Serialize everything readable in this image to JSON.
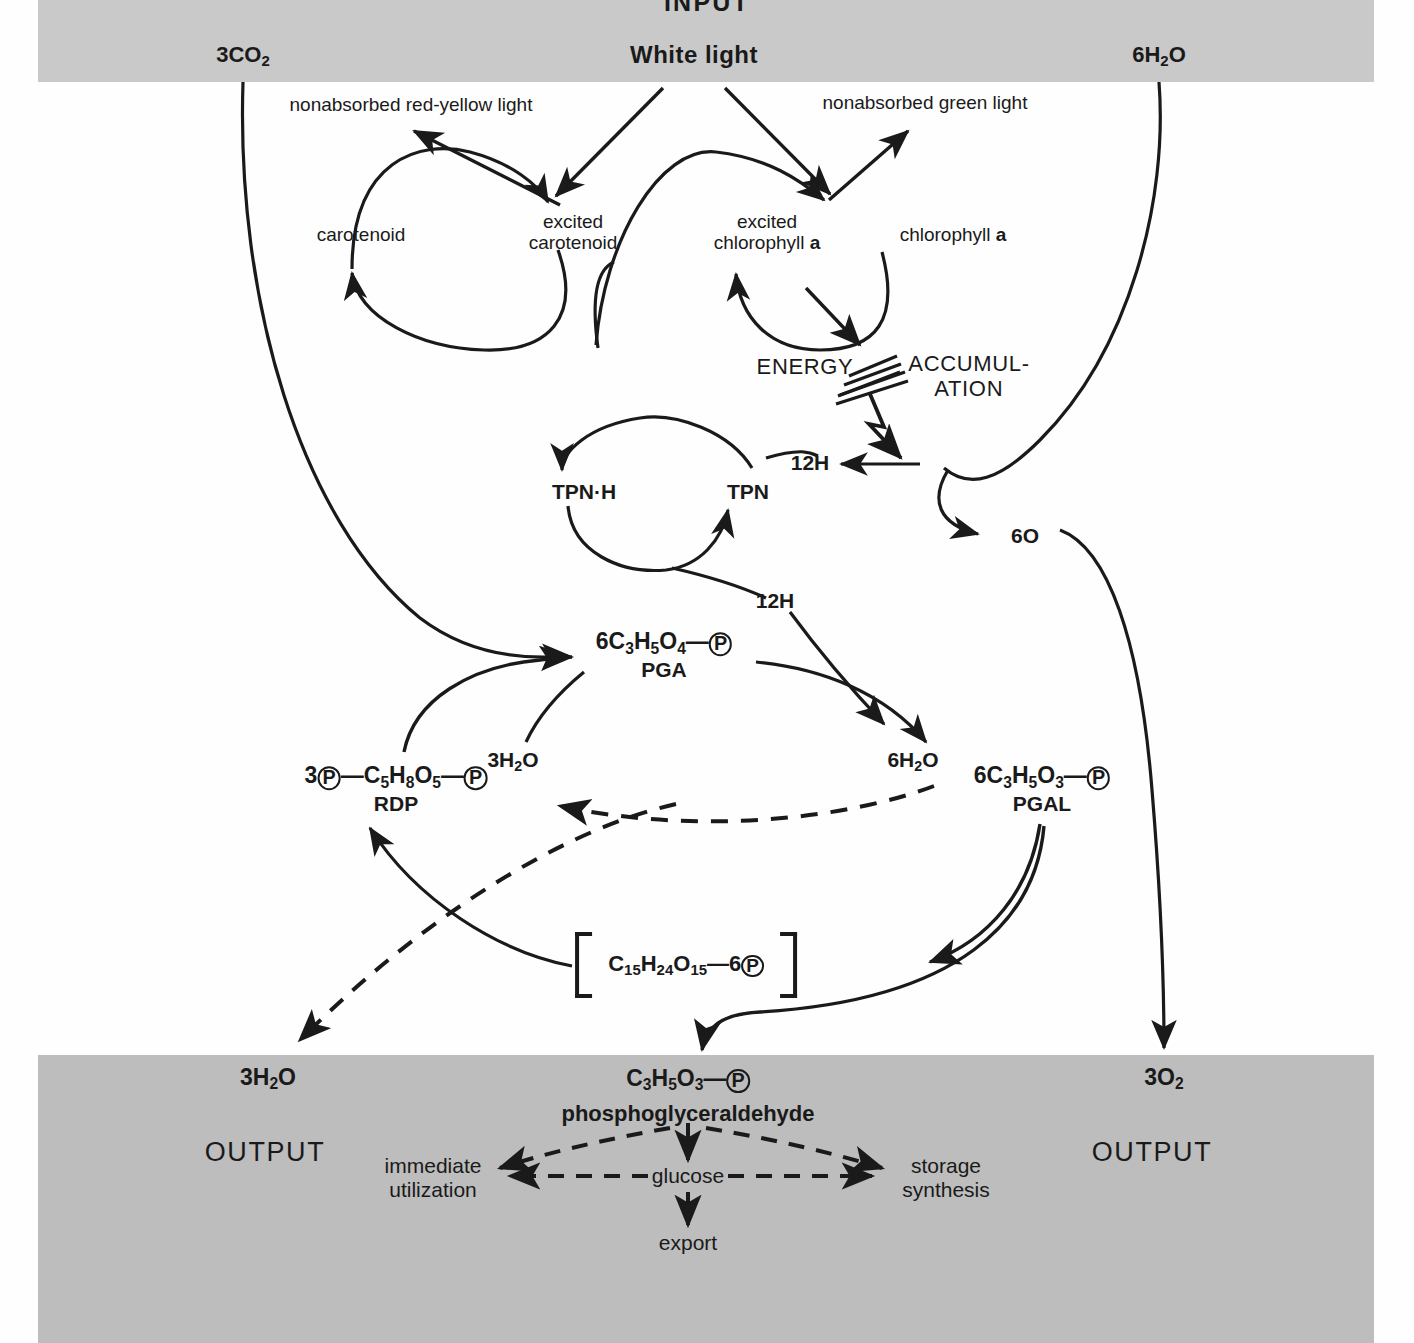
{
  "figure": {
    "kind": "photosynthesis-flow-diagram",
    "band_color": "#c9c9c9",
    "band_color_bottom": "#bdbdbd",
    "ink_color": "#1a1a1a",
    "page_color": "#fefefe"
  },
  "bands": {
    "input_label": "INPUT",
    "output_label_left": "OUTPUT",
    "output_label_right": "OUTPUT"
  },
  "inputs": {
    "co2": {
      "text": "3CO2",
      "num": "3",
      "formula": "CO",
      "sub": "2"
    },
    "light": "White  light",
    "water": {
      "text": "6H2O",
      "num": "6",
      "formula": "H",
      "sub": "2",
      "tail": "O"
    }
  },
  "pigment_cycle": {
    "nonabsorbed_red_yellow": "nonabsorbed red-yellow light",
    "nonabsorbed_green": "nonabsorbed green light",
    "carotenoid": "carotenoid",
    "excited_carotenoid_line1": "excited",
    "excited_carotenoid_line2": "carotenoid",
    "excited_chlorophyll_line1": "excited",
    "excited_chlorophyll_line2_a": "chlorophyll ",
    "excited_chlorophyll_line2_b": "a",
    "chlorophyll_a": "chlorophyll ",
    "chlorophyll_a_italicbold": "a"
  },
  "energy": {
    "word_left": "ENERGY",
    "word_right_line1": "ACCUMUL-",
    "word_right_line2": "ATION"
  },
  "tpn_cycle": {
    "tpnh": "TPN·H",
    "tpn": "TPN",
    "hydrogen_in": "12H",
    "hydrogen_out": "12H"
  },
  "oxygen_node": {
    "label": "6O"
  },
  "compounds": {
    "pga": {
      "coef": "6",
      "formula_c": "C",
      "sub_c": "3",
      "formula_h": "H",
      "sub_h": "5",
      "formula_o": "O",
      "sub_o": "4",
      "dash": "—",
      "p": "P",
      "name": "PGA"
    },
    "rdp": {
      "coef": "3",
      "p_left": "P",
      "dash1": "—",
      "formula_c": "C",
      "sub_c": "5",
      "formula_h": "H",
      "sub_h": "8",
      "formula_o": "O",
      "sub_o": "5",
      "dash2": "—",
      "p_right": "P",
      "name": "RDP"
    },
    "pgal": {
      "coef": "6",
      "formula_c": "C",
      "sub_c": "3",
      "formula_h": "H",
      "sub_h": "5",
      "formula_o": "O",
      "sub_o": "3",
      "dash": "—",
      "p": "P",
      "name": "PGAL"
    },
    "hexose_bracket": {
      "formula_c": "C",
      "sub_c": "15",
      "formula_h": "H",
      "sub_h": "24",
      "formula_o": "O",
      "sub_o": "15",
      "dash": "—",
      "coef_p": "6",
      "p": "P"
    },
    "pgald_output": {
      "formula_c": "C",
      "sub_c": "3",
      "formula_h": "H",
      "sub_h": "5",
      "formula_o": "O",
      "sub_o": "3",
      "dash": "—",
      "p": "P",
      "name": "phosphoglyceraldehyde"
    }
  },
  "water_nodes": {
    "left_3h2o": {
      "num": "3",
      "h": "H",
      "sub": "2",
      "o": "O"
    },
    "right_6h2o": {
      "num": "6",
      "h": "H",
      "sub": "2",
      "o": "O"
    },
    "output_3h2o": {
      "num": "3",
      "h": "H",
      "sub": "2",
      "o": "O"
    }
  },
  "oxygen_output": {
    "num": "3",
    "o": "O",
    "sub": "2"
  },
  "fates": {
    "immediate_line1": "immediate",
    "immediate_line2": "utilization",
    "glucose": "glucose",
    "storage_line1": "storage",
    "storage_line2": "synthesis",
    "export": "export"
  }
}
